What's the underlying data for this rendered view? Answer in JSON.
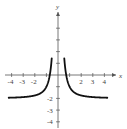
{
  "chart_data": {
    "type": "line",
    "title": "",
    "xlabel": "x",
    "ylabel": "y",
    "xlim": [
      -4.5,
      4.5
    ],
    "ylim": [
      -4,
      4.5
    ],
    "grid": false,
    "legend": null,
    "x_ticks": [
      -4,
      -3,
      -2,
      -1,
      1,
      2,
      3,
      4
    ],
    "x_tick_labels": [
      "-4",
      "-3",
      "-2",
      "2",
      "3",
      "4"
    ],
    "y_ticks": [
      -4,
      -3,
      -2,
      -1,
      1,
      2,
      3,
      4
    ],
    "y_tick_labels": [
      "-2",
      "-3",
      "-4"
    ],
    "asymptotes": {
      "vertical": 0,
      "horizontal": -2
    },
    "series": [
      {
        "name": "left branch",
        "x": [
          -4.2,
          -3,
          -2,
          -1.5,
          -1,
          -0.8,
          -0.7,
          -0.6,
          -0.55
        ],
        "y": [
          -1.94,
          -1.89,
          -1.75,
          -1.56,
          -1.0,
          -0.44,
          0.04,
          0.78,
          1.31
        ]
      },
      {
        "name": "right branch",
        "x": [
          0.55,
          0.6,
          0.7,
          0.8,
          1,
          1.5,
          2,
          3,
          4.2
        ],
        "y": [
          1.31,
          0.78,
          0.04,
          -0.44,
          -1.0,
          -1.56,
          -1.75,
          -1.89,
          -1.94
        ]
      }
    ],
    "curve_color": "#111111",
    "axis_color": "#555555"
  }
}
